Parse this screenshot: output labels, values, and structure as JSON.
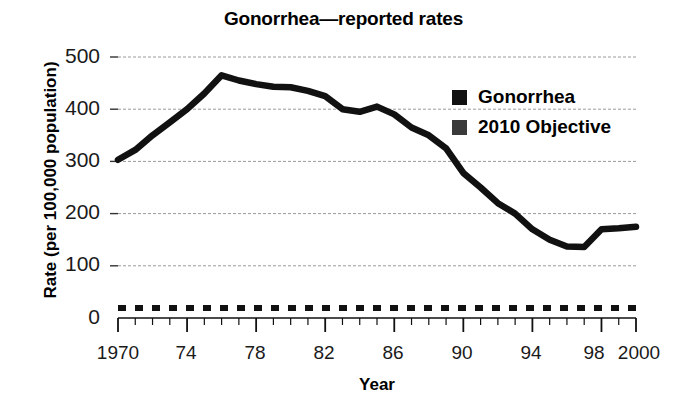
{
  "chart_data": {
    "type": "line",
    "title": "Gonorrhea—reported rates",
    "xlabel": "Year",
    "ylabel": "Rate (per 100,000 population)",
    "xlim": [
      1970,
      2000
    ],
    "ylim": [
      0,
      500
    ],
    "grid": true,
    "legend_position": "top-right",
    "x_tick_labels": [
      "1970",
      "74",
      "78",
      "82",
      "86",
      "90",
      "94",
      "98",
      "2000"
    ],
    "x_tick_values": [
      1970,
      1974,
      1978,
      1982,
      1986,
      1990,
      1994,
      1998,
      2000
    ],
    "y_tick_labels": [
      "0",
      "100",
      "200",
      "300",
      "400",
      "500"
    ],
    "y_tick_values": [
      0,
      100,
      200,
      300,
      400,
      500
    ],
    "x": [
      1970,
      1971,
      1972,
      1973,
      1974,
      1975,
      1976,
      1977,
      1978,
      1979,
      1980,
      1981,
      1982,
      1983,
      1984,
      1985,
      1986,
      1987,
      1988,
      1989,
      1990,
      1991,
      1992,
      1993,
      1994,
      1995,
      1996,
      1997,
      1998,
      1999,
      2000
    ],
    "series": [
      {
        "name": "Gonorrhea",
        "color": "#000000",
        "style": "solid",
        "values": [
          303,
          322,
          350,
          375,
          400,
          430,
          465,
          455,
          448,
          443,
          442,
          435,
          425,
          400,
          395,
          405,
          390,
          365,
          350,
          325,
          278,
          250,
          220,
          200,
          170,
          150,
          137,
          136,
          170,
          172,
          175
        ]
      },
      {
        "name": "2010 Objective",
        "color": "#1a1a1a",
        "style": "dotted",
        "values": [
          19,
          19,
          19,
          19,
          19,
          19,
          19,
          19,
          19,
          19,
          19,
          19,
          19,
          19,
          19,
          19,
          19,
          19,
          19,
          19,
          19,
          19,
          19,
          19,
          19,
          19,
          19,
          19,
          19,
          19,
          19
        ]
      }
    ],
    "legend": [
      {
        "label": "Gonorrhea",
        "swatch_color": "#111111"
      },
      {
        "label": "2010 Objective",
        "swatch_color": "#3a3a3a"
      }
    ]
  },
  "axis": {
    "y_labels": [
      "500",
      "400",
      "300",
      "200",
      "100",
      "0"
    ],
    "x_labels": [
      "1970",
      "74",
      "78",
      "82",
      "86",
      "90",
      "94",
      "98",
      "2000"
    ]
  }
}
